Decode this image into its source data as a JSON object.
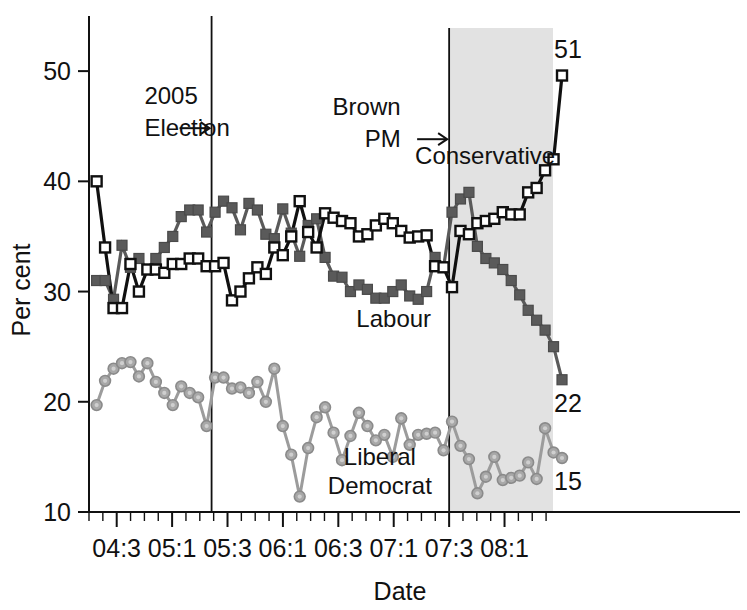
{
  "chart_data": {
    "type": "line",
    "title": "",
    "xlabel": "Date",
    "ylabel": "Per cent",
    "ylim": [
      10,
      55
    ],
    "xlim": [
      0,
      47
    ],
    "grid": false,
    "legend": "inline-annotations",
    "yticks": [
      10,
      20,
      30,
      40,
      50
    ],
    "ytick_labels": [
      "10",
      "20",
      "30",
      "40",
      "50"
    ],
    "xtick_labels": [
      "04:3",
      "05:1",
      "05:3",
      "06:1",
      "06:3",
      "07:1",
      "07:3",
      "08:1"
    ],
    "xtick_positions": [
      2,
      6,
      10,
      14,
      18,
      22,
      26,
      30
    ],
    "minor_tick_step": 1,
    "series": [
      {
        "name": "Conservative",
        "color": "#101010",
        "marker": "open-square",
        "label_x": 28.6,
        "label_y": 41.6,
        "end_label": "51",
        "values": [
          40.0,
          34.0,
          28.5,
          28.5,
          32.5,
          30.0,
          32.0,
          32.0,
          31.7,
          32.5,
          32.5,
          33.0,
          33.0,
          32.3,
          32.3,
          32.6,
          29.2,
          30.0,
          31.2,
          32.2,
          31.6,
          34.0,
          33.3,
          35.0,
          38.2,
          35.4,
          34.0,
          37.1,
          36.7,
          36.4,
          36.2,
          35.0,
          35.2,
          36.0,
          36.6,
          36.2,
          35.5,
          34.9,
          35.0,
          35.1,
          32.3,
          32.2,
          30.4,
          35.5,
          35.2,
          36.2,
          36.4,
          36.6,
          37.2,
          37.0,
          37.0,
          39.0,
          39.4,
          41.0,
          42.0,
          49.6
        ]
      },
      {
        "name": "Labour",
        "color": "#5a5a5a",
        "marker": "filled-square",
        "label_x": 22.0,
        "label_y": 26.8,
        "end_label": "22",
        "values": [
          31.0,
          31.0,
          29.3,
          34.2,
          32.2,
          33.0,
          32.0,
          33.0,
          34.0,
          35.0,
          36.8,
          37.4,
          37.4,
          35.4,
          37.2,
          38.2,
          37.6,
          35.6,
          38.0,
          37.4,
          35.2,
          34.8,
          37.5,
          35.3,
          33.2,
          36.0,
          36.6,
          33.1,
          31.4,
          31.3,
          30.0,
          30.6,
          30.2,
          29.4,
          29.4,
          30.0,
          30.6,
          29.6,
          29.3,
          30.0,
          33.1,
          32.2,
          37.2,
          38.4,
          39.0,
          34.1,
          33.0,
          32.6,
          32.0,
          31.0,
          29.7,
          28.3,
          27.4,
          26.5,
          25.0,
          22.0
        ]
      },
      {
        "name": "Liberal Democrat",
        "color": "#a8a8a8",
        "marker": "filled-circle",
        "label_x": 21.0,
        "label_y": 14.3,
        "end_label": "15",
        "values": [
          19.7,
          21.9,
          23.0,
          23.5,
          23.6,
          22.3,
          23.5,
          21.8,
          20.8,
          19.7,
          21.4,
          20.8,
          20.4,
          17.8,
          22.2,
          22.2,
          21.2,
          21.3,
          20.8,
          21.8,
          20.0,
          23.0,
          17.8,
          15.2,
          11.4,
          15.8,
          18.6,
          19.5,
          17.2,
          14.7,
          16.9,
          19.0,
          17.8,
          16.5,
          17.0,
          15.0,
          18.5,
          16.1,
          17.0,
          17.1,
          17.2,
          15.6,
          18.2,
          16.0,
          14.8,
          11.7,
          13.2,
          15.0,
          12.9,
          13.1,
          13.3,
          14.5,
          13.0,
          17.6,
          15.4,
          14.9
        ]
      }
    ],
    "annotations": [
      {
        "id": "election-2005",
        "lines": [
          "2005",
          "Election"
        ],
        "arrow": "right-arrow",
        "x": 8.85,
        "label_x": 4.0,
        "label_y": 47.0
      },
      {
        "id": "brown-pm",
        "lines": [
          "Brown",
          "PM"
        ],
        "arrow": "right-arrow",
        "x": 26.0,
        "label_x": 22.5,
        "label_y": 46.0
      }
    ],
    "shaded_region": {
      "name": "brown-pm-period",
      "from_x": 26.0,
      "to_x": 33.5,
      "color": "#e2e2e2"
    },
    "endpoint_labels": [
      {
        "series": "Conservative",
        "value": "51"
      },
      {
        "series": "Labour",
        "value": "22"
      },
      {
        "series": "Liberal Democrat",
        "value": "15"
      }
    ]
  }
}
